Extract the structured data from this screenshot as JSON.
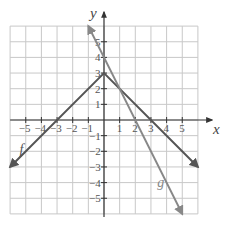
{
  "chart_data": {
    "type": "line",
    "title": "",
    "xlabel": "x",
    "ylabel": "y",
    "xlim": [
      -6,
      6
    ],
    "ylim": [
      -6,
      6
    ],
    "grid": true,
    "x_ticks": [
      -5,
      -4,
      -3,
      -2,
      -1,
      1,
      2,
      3,
      4,
      5
    ],
    "y_ticks": [
      5,
      4,
      3,
      2,
      1,
      -1,
      -2,
      -3,
      -4,
      -5
    ],
    "series": [
      {
        "name": "f",
        "expression": "f(x) = 3 - |x|",
        "points": [
          [
            -6,
            -3
          ],
          [
            0,
            3
          ],
          [
            6,
            -3
          ]
        ],
        "color": "#555555",
        "arrows": "both"
      },
      {
        "name": "g",
        "expression": "g(x) = 4 - 2x",
        "points": [
          [
            -1,
            6
          ],
          [
            5,
            -6
          ]
        ],
        "color": "#888888",
        "arrows": "both"
      }
    ],
    "labels": [
      {
        "text": "f",
        "x": -5.4,
        "y": -2.2
      },
      {
        "text": "g",
        "x": 3.4,
        "y": -4.3
      }
    ]
  },
  "style": {
    "grid_color": "#c8c8c8",
    "axis_color": "#333333",
    "f_color": "#555555",
    "g_color": "#888888"
  }
}
